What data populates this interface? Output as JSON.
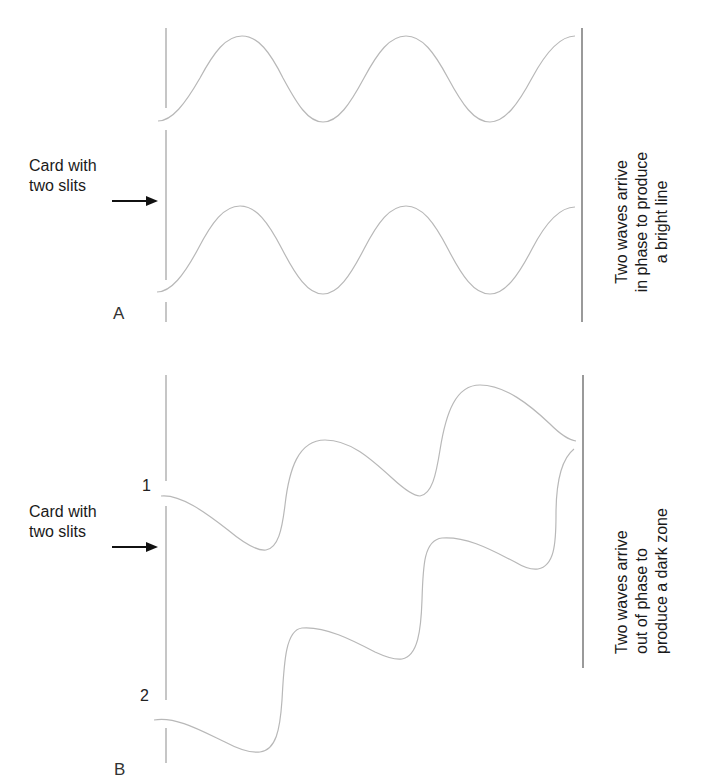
{
  "figure": {
    "panels": [
      {
        "id": "A",
        "letter": "A",
        "card_label": [
          "Card with",
          "two slits"
        ],
        "caption": [
          "Two waves arrive",
          "in phase to produce",
          "a bright line"
        ],
        "description": "Two waves from two slits arrive at the screen in phase (crest meets crest)"
      },
      {
        "id": "B",
        "letter": "B",
        "card_label": [
          "Card with",
          "two slits"
        ],
        "slit_labels": [
          "1",
          "2"
        ],
        "caption": [
          "Two waves arrive",
          "out of phase to",
          "produce a dark zone"
        ],
        "description": "Two waves from slits 1 and 2 arrive at the screen out of phase (crest meets trough)"
      }
    ],
    "colors": {
      "wave": "#b8b8b8",
      "card": "#a8a8a8",
      "screen": "#9a9a9a",
      "arrow": "#111111",
      "text": "#1a1a1a"
    }
  }
}
